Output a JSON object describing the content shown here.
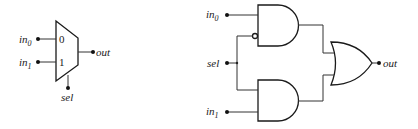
{
  "mux_symbol": {
    "inputs": [
      {
        "base": "in",
        "sub": "0",
        "port_label": "0"
      },
      {
        "base": "in",
        "sub": "1",
        "port_label": "1"
      }
    ],
    "select_label": "sel",
    "output_label": "out"
  },
  "gate_circuit": {
    "inputs": [
      {
        "base": "in",
        "sub": "0"
      },
      {
        "base": "in",
        "sub": "1"
      }
    ],
    "select_label": "sel",
    "output_label": "out",
    "gates": [
      "AND (inverted sel input)",
      "AND",
      "OR"
    ]
  },
  "colors": {
    "stroke": "#1a1a1a",
    "wire": "#333333",
    "background": "#ffffff"
  }
}
